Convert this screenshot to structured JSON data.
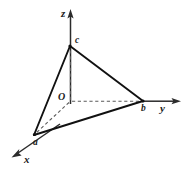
{
  "figure": {
    "type": "3d-coordinate-axes-triangle",
    "background_color": "#ffffff",
    "line_color": "#111111",
    "axis_color": "#2b2b2b",
    "dashed_color": "#5a5a5a",
    "axes": [
      {
        "name": "z",
        "label": "z",
        "direction": "up",
        "label_x": 61,
        "label_y": 8
      },
      {
        "name": "y",
        "label": "y",
        "direction": "right",
        "label_x": 160,
        "label_y": 103
      },
      {
        "name": "x",
        "label": "x",
        "direction": "down-left",
        "label_x": 24,
        "label_y": 154
      }
    ],
    "origin": {
      "label": "O",
      "label_x": 58,
      "label_y": 92,
      "x": 70,
      "y": 101
    },
    "vertices": [
      {
        "name": "a",
        "label": "a",
        "axis": "x",
        "x": 34,
        "y": 135,
        "label_x": 33,
        "label_y": 138
      },
      {
        "name": "b",
        "label": "b",
        "axis": "y",
        "x": 143,
        "y": 101,
        "label_x": 141,
        "label_y": 104
      },
      {
        "name": "c",
        "label": "c",
        "axis": "z",
        "x": 70,
        "y": 46,
        "label_x": 75,
        "label_y": 36
      }
    ],
    "solid_edges": [
      {
        "from": "c",
        "to": "a"
      },
      {
        "from": "c",
        "to": "b"
      },
      {
        "from": "a",
        "to": "b"
      }
    ],
    "dashed_segments": [
      {
        "from": "O",
        "to": "c"
      },
      {
        "from": "O",
        "to": "a"
      },
      {
        "from": "O",
        "to": "b"
      }
    ]
  }
}
